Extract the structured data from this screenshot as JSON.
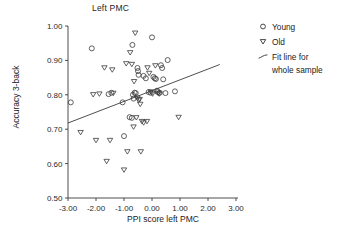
{
  "chart_data": {
    "type": "scatter",
    "title": "Left PMC",
    "xlabel": "PPI score left PMC",
    "ylabel": "Accuracy 3-back",
    "xlim": [
      -3.5,
      3.35
    ],
    "ylim": [
      0.47,
      1.015
    ],
    "xticks": [
      "-3.00",
      "-2.00",
      "-1.00",
      "0.00",
      "1.00",
      "2.00",
      "3.00"
    ],
    "xtick_values": [
      -3,
      -2,
      -1,
      0,
      1,
      2,
      3
    ],
    "yticks": [
      "0.50",
      "0.60",
      "0.70",
      "0.80",
      "0.90",
      "1.00"
    ],
    "ytick_values": [
      0.5,
      0.6,
      0.7,
      0.8,
      0.9,
      1.0
    ],
    "grid": false,
    "legend_position": "right",
    "series": [
      {
        "name": "Young",
        "marker": "circle-open",
        "points": [
          [
            -2.9,
            0.778
          ],
          [
            -2.15,
            0.935
          ],
          [
            -1.45,
            0.806
          ],
          [
            -1.55,
            0.802
          ],
          [
            -1.05,
            0.778
          ],
          [
            -1.0,
            0.68
          ],
          [
            -0.8,
            0.735
          ],
          [
            -0.72,
            0.733
          ],
          [
            -0.7,
            0.945
          ],
          [
            -0.68,
            0.8
          ],
          [
            -0.66,
            0.789
          ],
          [
            -0.62,
            0.806
          ],
          [
            -0.58,
            0.805
          ],
          [
            -0.52,
            0.878
          ],
          [
            -0.5,
            0.869
          ],
          [
            -0.48,
            0.858
          ],
          [
            -0.3,
            0.855
          ],
          [
            -0.22,
            0.848
          ],
          [
            -0.12,
            0.808
          ],
          [
            -0.05,
            0.806
          ],
          [
            0.0,
            0.967
          ],
          [
            0.05,
            0.852
          ],
          [
            0.1,
            0.848
          ],
          [
            0.14,
            0.846
          ],
          [
            0.18,
            0.812
          ],
          [
            0.2,
            0.808
          ],
          [
            0.28,
            0.806
          ],
          [
            0.32,
            0.886
          ],
          [
            0.36,
            0.878
          ],
          [
            0.4,
            0.845
          ],
          [
            0.48,
            0.805
          ],
          [
            0.56,
            0.901
          ],
          [
            0.82,
            0.81
          ]
        ]
      },
      {
        "name": "Old",
        "marker": "triangle-down-open",
        "points": [
          [
            -2.55,
            0.69
          ],
          [
            -2.1,
            0.8
          ],
          [
            -2.0,
            0.667
          ],
          [
            -1.88,
            0.802
          ],
          [
            -1.7,
            0.878
          ],
          [
            -1.62,
            0.606
          ],
          [
            -1.5,
            0.667
          ],
          [
            -1.42,
            0.872
          ],
          [
            -1.38,
            0.804
          ],
          [
            -1.0,
            0.581
          ],
          [
            -0.92,
            0.89
          ],
          [
            -0.88,
            0.634
          ],
          [
            -0.78,
            0.922
          ],
          [
            -0.72,
            0.888
          ],
          [
            -0.66,
            0.706
          ],
          [
            -0.64,
            0.838
          ],
          [
            -0.6,
            0.979
          ],
          [
            -0.56,
            0.733
          ],
          [
            -0.52,
            0.79
          ],
          [
            -0.48,
            0.784
          ],
          [
            -0.44,
            0.786
          ],
          [
            -0.42,
            0.772
          ],
          [
            -0.4,
            0.634
          ],
          [
            -0.36,
            0.722
          ],
          [
            -0.3,
            0.718
          ],
          [
            -0.18,
            0.722
          ],
          [
            -0.16,
            0.878
          ],
          [
            -0.1,
            0.862
          ],
          [
            -0.04,
            0.808
          ],
          [
            0.02,
            0.802
          ],
          [
            0.12,
            0.884
          ],
          [
            0.22,
            0.804
          ],
          [
            0.26,
            0.802
          ],
          [
            0.95,
            0.734
          ]
        ]
      }
    ],
    "fit_line": {
      "name": "Fit line for whole sample",
      "x_start": -3.0,
      "y_start": 0.718,
      "x_end": 2.42,
      "y_end": 0.888
    }
  },
  "legend": {
    "items": [
      {
        "label": "Young",
        "marker": "circle-open-icon"
      },
      {
        "label": "Old",
        "marker": "triangle-down-open-icon"
      },
      {
        "label": "Fit line for\nwhole sample",
        "marker": "line-segment-icon"
      }
    ]
  }
}
